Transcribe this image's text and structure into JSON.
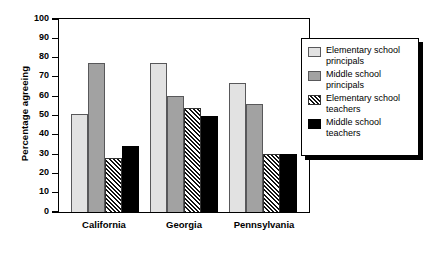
{
  "chart_data": {
    "type": "bar",
    "title": "",
    "xlabel": "",
    "ylabel": "Percentage agreeing",
    "ylim": [
      0,
      100
    ],
    "yticks": [
      0,
      10,
      20,
      30,
      40,
      50,
      60,
      70,
      80,
      90,
      100
    ],
    "grid": false,
    "legend_position": "right",
    "categories": [
      "California",
      "Georgia",
      "Pennsylvania"
    ],
    "series": [
      {
        "name": "Elementary school principals",
        "values": [
          51,
          77,
          67
        ],
        "color": "#e2e2e2",
        "pattern": "solid-light-gray"
      },
      {
        "name": "Middle school principals",
        "values": [
          77,
          60,
          56
        ],
        "color": "#a2a2a2",
        "pattern": "solid-mid-gray"
      },
      {
        "name": "Elementary school teachers",
        "values": [
          28,
          54,
          30
        ],
        "color": "#ffffff",
        "pattern": "diagonal-hatch"
      },
      {
        "name": "Middle school teachers",
        "values": [
          34,
          50,
          30
        ],
        "color": "#000000",
        "pattern": "solid-black"
      }
    ]
  },
  "legend": {
    "entries": [
      {
        "label": "Elementary school principals"
      },
      {
        "label": "Middle school principals"
      },
      {
        "label": "Elementary school teachers"
      },
      {
        "label": "Middle school teachers"
      }
    ]
  }
}
